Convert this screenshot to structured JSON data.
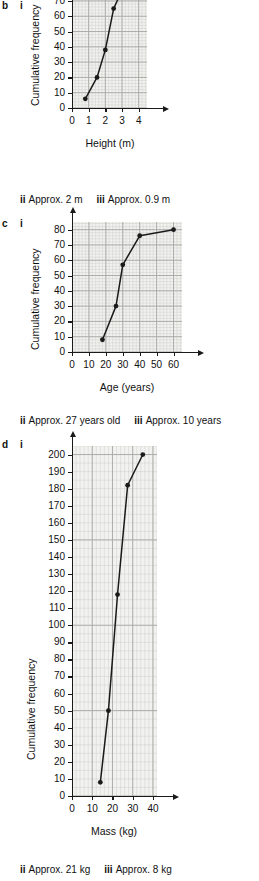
{
  "page": {
    "background": "#ffffff",
    "ink": "#1a1a1a",
    "grid_fill": "#f2f2f0",
    "grid_minor": "#cfcfcb",
    "grid_major": "#a8a8a4"
  },
  "parts": [
    {
      "letter": "b",
      "roman": "i"
    },
    {
      "letter": "c",
      "roman": "i"
    },
    {
      "letter": "d",
      "roman": "i"
    }
  ],
  "answers": [
    {
      "for_part": "b",
      "segments": [
        {
          "roman": "ii",
          "text": "Approx. 2 m"
        },
        {
          "roman": "iii",
          "text": "Approx. 0.9 m"
        }
      ]
    },
    {
      "for_part": "c",
      "segments": [
        {
          "roman": "ii",
          "text": "Approx. 27 years old"
        },
        {
          "roman": "iii",
          "text": "Approx. 10 years"
        }
      ]
    },
    {
      "for_part": "d",
      "segments": [
        {
          "roman": "ii",
          "text": "Approx. 21 kg"
        },
        {
          "roman": "iii",
          "text": "Approx. 8 kg"
        }
      ]
    }
  ],
  "chart_data": [
    {
      "id": "chart-b",
      "type": "line",
      "title": "",
      "xlabel": "Height (m)",
      "ylabel": "Cumulative frequency",
      "xlim": [
        0,
        4.5
      ],
      "ylim": [
        0,
        85
      ],
      "xticks": [
        0,
        1,
        2,
        3,
        4
      ],
      "yticks": [
        0,
        10,
        20,
        30,
        40,
        50,
        60,
        70,
        80
      ],
      "grid": true,
      "grid_minor_step_x": 0.2,
      "grid_minor_step_y": 2,
      "grid_major_step_x": 1,
      "grid_major_step_y": 10,
      "legend": "none",
      "markers": true,
      "x": [
        0.8,
        1.5,
        2.0,
        2.5,
        3.0,
        4.0
      ],
      "y": [
        6,
        20,
        38,
        65,
        77,
        80
      ],
      "points": [
        {
          "x": 0.8,
          "y": 6
        },
        {
          "x": 1.5,
          "y": 20
        },
        {
          "x": 2.0,
          "y": 38
        },
        {
          "x": 2.5,
          "y": 65
        },
        {
          "x": 3.0,
          "y": 77
        },
        {
          "x": 4.0,
          "y": 80
        }
      ]
    },
    {
      "id": "chart-c",
      "type": "line",
      "title": "",
      "xlabel": "Age (years)",
      "ylabel": "Cumulative frequency",
      "xlim": [
        0,
        65
      ],
      "ylim": [
        0,
        85
      ],
      "xticks": [
        0,
        10,
        20,
        30,
        40,
        50,
        60
      ],
      "yticks": [
        0,
        10,
        20,
        30,
        40,
        50,
        60,
        70,
        80
      ],
      "grid": true,
      "grid_minor_step_x": 2,
      "grid_minor_step_y": 2,
      "grid_major_step_x": 10,
      "grid_major_step_y": 10,
      "legend": "none",
      "markers": true,
      "x": [
        18,
        26,
        30,
        40,
        60
      ],
      "y": [
        8,
        30,
        57,
        76,
        80
      ],
      "points": [
        {
          "x": 18,
          "y": 8
        },
        {
          "x": 26,
          "y": 30
        },
        {
          "x": 30,
          "y": 57
        },
        {
          "x": 40,
          "y": 76
        },
        {
          "x": 60,
          "y": 80
        }
      ]
    },
    {
      "id": "chart-d",
      "type": "line",
      "title": "",
      "xlabel": "Mass (kg)",
      "ylabel": "Cumulative frequency",
      "xlim": [
        0,
        42
      ],
      "ylim": [
        0,
        205
      ],
      "xticks": [
        0,
        10,
        20,
        30,
        40
      ],
      "yticks": [
        0,
        10,
        20,
        30,
        40,
        50,
        60,
        70,
        80,
        90,
        100,
        110,
        120,
        130,
        140,
        150,
        160,
        170,
        180,
        190,
        200
      ],
      "grid": true,
      "grid_minor_step_x": 2,
      "grid_minor_step_y": 5,
      "grid_major_step_x": 10,
      "grid_major_step_y": 50,
      "legend": "none",
      "markers": true,
      "x": [
        14,
        18,
        22.5,
        27.5,
        35
      ],
      "y": [
        8,
        50,
        118,
        182,
        200
      ],
      "points": [
        {
          "x": 14,
          "y": 8
        },
        {
          "x": 18,
          "y": 50
        },
        {
          "x": 22.5,
          "y": 118
        },
        {
          "x": 27.5,
          "y": 182
        },
        {
          "x": 35,
          "y": 200
        }
      ]
    }
  ],
  "layout": {
    "charts": [
      {
        "id": "chart-b",
        "left": 0,
        "top": -22,
        "width": 259,
        "height": 200,
        "plot": {
          "x": 72,
          "y": 0,
          "w": 75,
          "h": 130
        },
        "xaxis_y": 130,
        "yaxis_x": 72,
        "ylabel_x": 30,
        "ylabel_y": 128,
        "xlabel_x": 110,
        "xlabel_y": 160
      },
      {
        "id": "chart-c",
        "left": 0,
        "top": 218,
        "width": 259,
        "height": 200,
        "plot": {
          "x": 72,
          "y": 4,
          "w": 110,
          "h": 130
        },
        "xaxis_y": 134,
        "yaxis_x": 72,
        "ylabel_x": 30,
        "ylabel_y": 132,
        "xlabel_x": 127,
        "xlabel_y": 164
      },
      {
        "id": "chart-d",
        "left": 0,
        "top": 440,
        "width": 259,
        "height": 420,
        "plot": {
          "x": 72,
          "y": 6,
          "w": 85,
          "h": 350
        },
        "xaxis_y": 356,
        "yaxis_x": 72,
        "ylabel_x": 26,
        "ylabel_y": 320,
        "xlabel_x": 114,
        "xlabel_y": 386
      }
    ],
    "part_markers": [
      {
        "letter": "b",
        "lx": 2,
        "ly": 1,
        "rx": 20,
        "ry": 1
      },
      {
        "letter": "c",
        "lx": 2,
        "ly": 219,
        "rx": 20,
        "ry": 219
      },
      {
        "letter": "d",
        "lx": 2,
        "ly": 440,
        "rx": 20,
        "ry": 440
      }
    ],
    "answer_lines": [
      {
        "for_part": "b",
        "x": 20,
        "y": 195
      },
      {
        "for_part": "c",
        "x": 20,
        "y": 416
      },
      {
        "for_part": "d",
        "x": 20,
        "y": 865
      }
    ]
  }
}
